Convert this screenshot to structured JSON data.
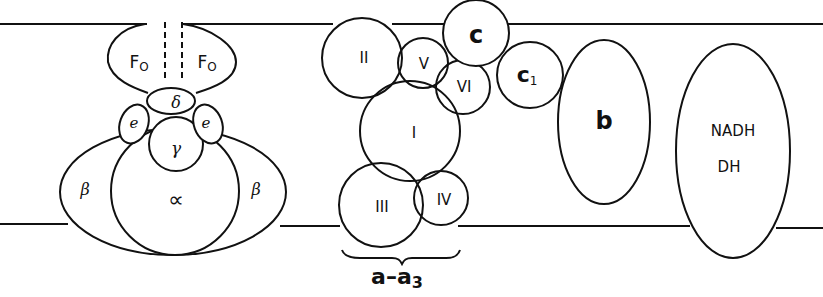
{
  "diagram": {
    "type": "membrane protein complexes schematic",
    "membrane": {
      "top_y": 24,
      "bottom_y": 224
    },
    "atp_synthase": {
      "labels": {
        "f0_left": "F",
        "f0_left_sub": "O",
        "f0_right": "F",
        "f0_right_sub": "O",
        "delta": "δ",
        "epsilon_left": "e",
        "epsilon_right": "e",
        "gamma": "γ",
        "alpha": "∝",
        "beta_left": "β",
        "beta_right": "β"
      }
    },
    "cytochrome_oxidase": {
      "subunits": [
        "I",
        "II",
        "III",
        "IV",
        "V",
        "VI"
      ],
      "bracket_label": "a–a",
      "bracket_label_sub": "3"
    },
    "cytochromes": {
      "c": "c",
      "c1": "c",
      "c1_sub": "1",
      "b": "b"
    },
    "nadh_dehydrogenase": {
      "line1": "NADH",
      "line2": "DH"
    }
  }
}
